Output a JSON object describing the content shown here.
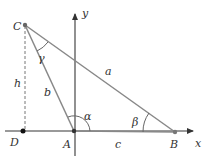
{
  "diagram": {
    "axes": {
      "x_label": "x",
      "y_label": "y"
    },
    "points": {
      "A": "A",
      "B": "B",
      "C": "C",
      "D": "D"
    },
    "sides": {
      "a": "a",
      "b": "b",
      "c": "c",
      "h": "h"
    },
    "angles": {
      "alpha": "α",
      "beta": "β",
      "gamma": "γ"
    },
    "colors": {
      "line": "#888888",
      "axis": "#555555",
      "text": "#333333",
      "point": "#222222"
    }
  }
}
